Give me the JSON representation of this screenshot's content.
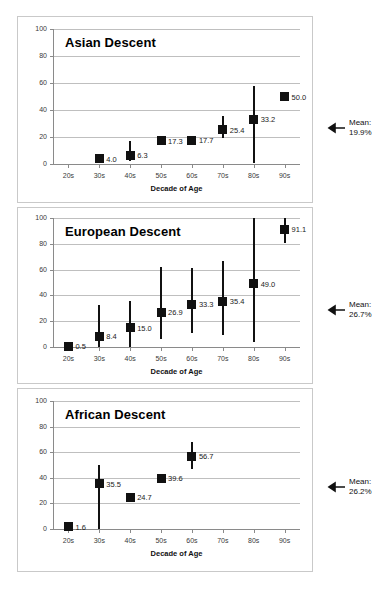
{
  "figure": {
    "background": "#ffffff",
    "marker_color": "#111111",
    "grid_color": "#bfbfbf",
    "panel_border_color": "#c9c9c9"
  },
  "chart_data": [
    {
      "type": "scatter",
      "title": "Asian Descent",
      "xlabel": "Decade of Age",
      "ylabel": "",
      "categories": [
        "20s",
        "30s",
        "40s",
        "50s",
        "60s",
        "70s",
        "80s",
        "90s"
      ],
      "yticks": [
        0,
        20,
        40,
        60,
        80,
        100
      ],
      "ylim": [
        0,
        100
      ],
      "grid": true,
      "legend": "none",
      "values": [
        null,
        4.0,
        6.3,
        17.3,
        17.7,
        25.4,
        33.2,
        50.0
      ],
      "point_labels": [
        "",
        "4.0",
        "6.3",
        "17.3",
        "17.7",
        "25.4",
        "33.2",
        "50.0"
      ],
      "error_low": [
        null,
        1.5,
        2.0,
        15.0,
        15.5,
        19.5,
        0.5,
        50.0
      ],
      "error_high": [
        null,
        7.0,
        17.0,
        20.0,
        20.0,
        35.5,
        58.0,
        50.0
      ],
      "annotation": {
        "name": "mean-arrow-annotation",
        "label": "Mean:\n19.9%",
        "value": 19.9,
        "points_to_y": 19.9
      }
    },
    {
      "type": "scatter",
      "title": "European Descent",
      "xlabel": "Decade of Age",
      "ylabel": "",
      "categories": [
        "20s",
        "30s",
        "40s",
        "50s",
        "60s",
        "70s",
        "80s",
        "90s"
      ],
      "yticks": [
        0,
        20,
        40,
        60,
        80,
        100
      ],
      "ylim": [
        0,
        100
      ],
      "grid": true,
      "legend": "none",
      "values": [
        0.5,
        8.4,
        15.0,
        26.9,
        33.3,
        35.4,
        49.0,
        91.1
      ],
      "point_labels": [
        "0.5",
        "8.4",
        "15.0",
        "26.9",
        "33.3",
        "35.4",
        "49.0",
        "91.1"
      ],
      "error_low": [
        0.5,
        0.0,
        0.0,
        6.0,
        10.5,
        9.5,
        4.0,
        81.0
      ],
      "error_high": [
        0.5,
        32.5,
        36.0,
        62.0,
        61.0,
        67.0,
        101.0,
        101.0
      ],
      "annotation": {
        "name": "mean-arrow-annotation",
        "label": "Mean:\n26.7%",
        "value": 26.7,
        "points_to_y": 38.0
      }
    },
    {
      "type": "scatter",
      "title": "African Descent",
      "xlabel": "Decade of Age",
      "ylabel": "",
      "categories": [
        "20s",
        "30s",
        "40s",
        "50s",
        "60s",
        "70s",
        "80s",
        "90s"
      ],
      "yticks": [
        0,
        20,
        40,
        60,
        80,
        100
      ],
      "ylim": [
        0,
        100
      ],
      "grid": true,
      "legend": "none",
      "values": [
        1.6,
        35.5,
        24.7,
        39.6,
        56.7,
        null,
        null,
        null
      ],
      "point_labels": [
        "1.6",
        "35.5",
        "24.7",
        "39.6",
        "56.7",
        "",
        "",
        ""
      ],
      "error_low": [
        1.6,
        0.0,
        22.0,
        37.0,
        46.5,
        null,
        null,
        null
      ],
      "error_high": [
        1.6,
        50.0,
        27.5,
        43.0,
        68.0,
        null,
        null,
        null
      ],
      "annotation": {
        "name": "mean-arrow-annotation",
        "label": "Mean:\n26.2%",
        "value": 26.2,
        "points_to_y": 30.0
      }
    }
  ]
}
